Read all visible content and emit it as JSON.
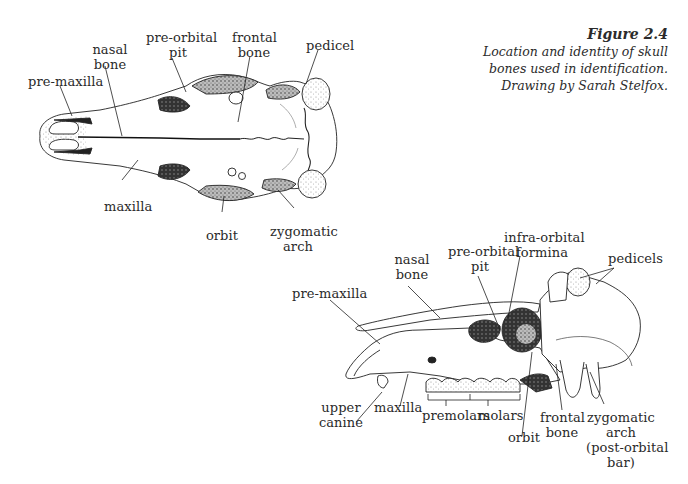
{
  "caption": {
    "figure_number": "Figure 2.4",
    "line1": "Location and identity of skull",
    "line2": "bones used in identification.",
    "line3": "Drawing by Sarah Stelfox."
  },
  "dorsal_view": {
    "labels": {
      "nasal_bone": [
        "nasal",
        "bone"
      ],
      "pre_orbital_pit": [
        "pre-orbital",
        "pit"
      ],
      "frontal_bone": [
        "frontal",
        "bone"
      ],
      "pedicel": "pedicel",
      "pre_maxilla": "pre-maxilla",
      "maxilla": "maxilla",
      "orbit": "orbit",
      "zygomatic_arch": [
        "zygomatic",
        "arch"
      ]
    }
  },
  "lateral_view": {
    "labels": {
      "nasal_bone": [
        "nasal",
        "bone"
      ],
      "pre_orbital_pit": [
        "pre-orbital",
        "pit"
      ],
      "infra_orbital_formina": [
        "infra-orbital",
        "formina"
      ],
      "pedicels": "pedicels",
      "pre_maxilla": "pre-maxilla",
      "upper_canine": [
        "upper",
        "canine"
      ],
      "maxilla": "maxilla",
      "premolars": "premolars",
      "molars": "molars",
      "orbit": "orbit",
      "frontal_bone": [
        "frontal",
        "bone"
      ],
      "zygomatic_arch": [
        "zygomatic",
        "arch",
        "(post-orbital",
        "bar)"
      ]
    }
  }
}
